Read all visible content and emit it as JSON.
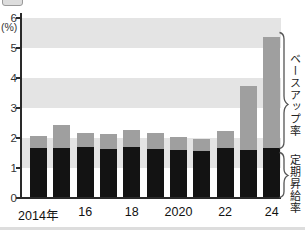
{
  "chart_data": {
    "type": "bar",
    "stacked": true,
    "categories": [
      "2014",
      "2015",
      "2016",
      "2017",
      "2018",
      "2019",
      "2020",
      "2021",
      "2022",
      "2023",
      "2024"
    ],
    "series": [
      {
        "name": "定期昇給率",
        "color": "#111111",
        "values": [
          1.63,
          1.63,
          1.68,
          1.6,
          1.65,
          1.6,
          1.58,
          1.52,
          1.63,
          1.58,
          1.62
        ]
      },
      {
        "name": "ベースアップ率",
        "color": "#9f9f9f",
        "values": [
          0.42,
          0.77,
          0.47,
          0.5,
          0.57,
          0.55,
          0.42,
          0.4,
          0.57,
          2.12,
          3.7
        ]
      }
    ],
    "totals": [
      2.05,
      2.4,
      2.15,
      2.1,
      2.22,
      2.15,
      2.0,
      1.92,
      2.2,
      3.7,
      5.32
    ],
    "title": "",
    "xlabel": "",
    "ylabel": "(%)",
    "y_axis": {
      "min": 0,
      "max": 6,
      "unit": "(%)",
      "tick_labels": [
        "6",
        "5",
        "4",
        "3",
        "2",
        "1",
        "0"
      ]
    },
    "x_tick_labels": [
      "2014年",
      "16",
      "18",
      "2020",
      "22",
      "24"
    ],
    "x_tick_positions": [
      0,
      2,
      4,
      6,
      8,
      10
    ],
    "grid": "alternating horizontal gray bands over odd intervals (1-2, 3-4, 5-6)",
    "legend_position": "right-side brackets with vertical labels",
    "annotations": [
      {
        "label": "ベースアップ率",
        "side": "right",
        "marks": "gray upper segment of 2024 bar"
      },
      {
        "label": "定期昇給率",
        "side": "right",
        "marks": "black lower segment of 2024 bar"
      }
    ],
    "colors": {
      "bar_black": "#131313",
      "bar_gray": "#9f9f9f",
      "band_gray": "#e4e4e4",
      "axis": "#2a2a2a",
      "bracket": "#555555"
    }
  }
}
